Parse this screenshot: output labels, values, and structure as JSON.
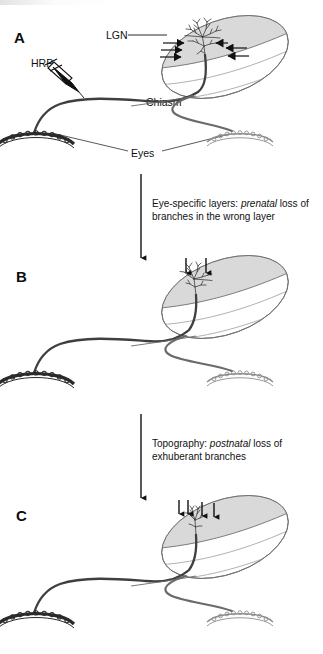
{
  "figure": {
    "type": "scientific-diagram",
    "background_color": "#ffffff",
    "ink_color": "#111111",
    "lgn_shade_color": "#d6d6d6",
    "axon_color": "#3a3a3a"
  },
  "panels": [
    {
      "letter": "A",
      "stage_label": "immature exuberant arbor",
      "labels": [
        {
          "name": "lgn-label",
          "text": "LGN"
        },
        {
          "name": "hrp-label",
          "text": "HRP"
        },
        {
          "name": "chiasm-label",
          "text": "Chiasm"
        },
        {
          "name": "eyes-label",
          "text": "Eyes"
        }
      ],
      "arrow_count": 6,
      "arrow_direction": "horizontal-inward",
      "has_injection_pipette": true
    },
    {
      "letter": "B",
      "stage_label": "eye-specific layer refinement",
      "labels": [],
      "arrow_count": 2,
      "arrow_direction": "vertical-down",
      "has_injection_pipette": false
    },
    {
      "letter": "C",
      "stage_label": "topographic refinement",
      "labels": [],
      "arrow_count": 4,
      "arrow_direction": "vertical-down",
      "has_injection_pipette": false
    }
  ],
  "transitions": [
    {
      "name": "transition-a-to-b",
      "line1_prefix": "Eye-specific layers: ",
      "line1_emphasis": "prenatal",
      "line1_suffix": " loss of",
      "line2": "branches in the wrong layer",
      "arrow": "down-arrow"
    },
    {
      "name": "transition-b-to-c",
      "line1_prefix": "Topography: ",
      "line1_emphasis": "postnatal",
      "line1_suffix": " loss of",
      "line2": "exhuberant branches",
      "arrow": "down-arrow"
    }
  ]
}
